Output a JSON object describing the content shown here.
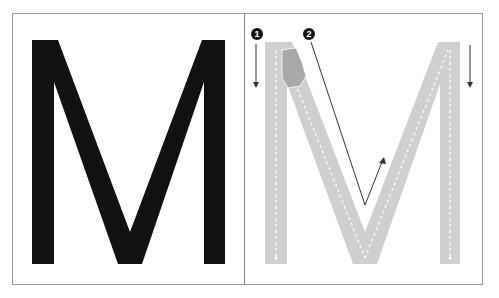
{
  "diagram": {
    "left_panel": {
      "letter": "M",
      "letter_color": "#111111"
    },
    "right_panel": {
      "letter": "M",
      "trace_color": "#cfcfcf",
      "guide_color": "#ffffff",
      "steps": [
        {
          "number": "1",
          "direction": "down",
          "description": "left stem stroke downward"
        },
        {
          "number": "2",
          "direction": "down-diagonal-then-up",
          "description": "diagonal down to the V then up"
        }
      ],
      "right_arrow_direction": "down"
    },
    "colors": {
      "border": "#9a9a9a",
      "arrow": "#333333",
      "badge_bg": "#111111",
      "badge_text": "#ffffff"
    }
  }
}
